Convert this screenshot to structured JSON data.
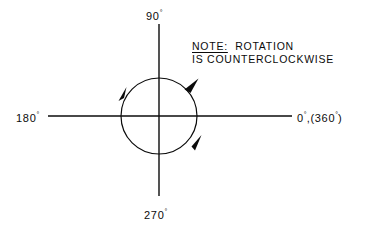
{
  "diagram": {
    "background_color": "#ffffff",
    "line_color": "#0b0b0b",
    "axis_labels": {
      "top": {
        "value": "90",
        "degree_symbol": "°"
      },
      "bottom": {
        "value": "270",
        "degree_symbol": "°"
      },
      "left": {
        "value": "180",
        "degree_symbol": "°"
      },
      "right": {
        "primary_value": "0",
        "degree_symbol": "°",
        "separator": ",(",
        "secondary_value": "360",
        "closing": ")"
      }
    },
    "note": {
      "keyword": "NOTE:",
      "line1": "ROTATION",
      "line2": "IS COUNTERCLOCKWISE"
    },
    "geometry": {
      "center_x": 159,
      "center_y": 116,
      "radius": 38,
      "vertical_axis_top": 24,
      "vertical_axis_bottom": 196,
      "horizontal_axis_left": 48,
      "horizontal_axis_right": 292
    },
    "rotation_direction": "counterclockwise",
    "arrow_angles_deg": [
      48,
      140,
      310
    ]
  }
}
